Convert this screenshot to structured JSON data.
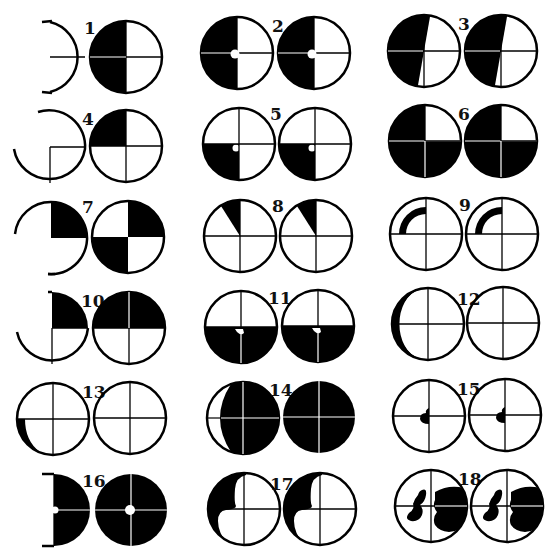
{
  "figure": {
    "ink_color": "#000000",
    "paper_color": "#ffffff",
    "pairs": [
      {
        "number": "1",
        "pattern": "left-half-black",
        "left_variant": "partial-outline"
      },
      {
        "number": "2",
        "pattern": "left-half-black-with-center-notch"
      },
      {
        "number": "3",
        "pattern": "tilted-left-half-black"
      },
      {
        "number": "4",
        "pattern": "upper-left-quadrant-black",
        "left_variant": "partial-outline"
      },
      {
        "number": "5",
        "pattern": "lower-left-quadrant-black-with-notch"
      },
      {
        "number": "6",
        "pattern": "three-quadrants-black-upper-right-white"
      },
      {
        "number": "7",
        "pattern": "checker-upper-right-lower-left-black",
        "left_variant": "partial-outline"
      },
      {
        "number": "8",
        "pattern": "narrow-wedge-upper-left"
      },
      {
        "number": "9",
        "pattern": "arc-band-upper-left"
      },
      {
        "number": "10",
        "pattern": "upper-half-black",
        "left_variant": "partial-outline"
      },
      {
        "number": "11",
        "pattern": "lower-half-black-with-notch"
      },
      {
        "number": "12",
        "pattern": "left-crescent-only-on-left-circle"
      },
      {
        "number": "13",
        "pattern": "small-lower-left-crescent-only-on-left-circle"
      },
      {
        "number": "14",
        "pattern": "full-black-left-has-crescent-gap"
      },
      {
        "number": "15",
        "pattern": "small-center-blob"
      },
      {
        "number": "16",
        "pattern": "full-black-with-center-hole",
        "left_variant": "partial-outline"
      },
      {
        "number": "17",
        "pattern": "wavy-left-black-region"
      },
      {
        "number": "18",
        "pattern": "irregular-blobs-left-and-right"
      }
    ]
  }
}
